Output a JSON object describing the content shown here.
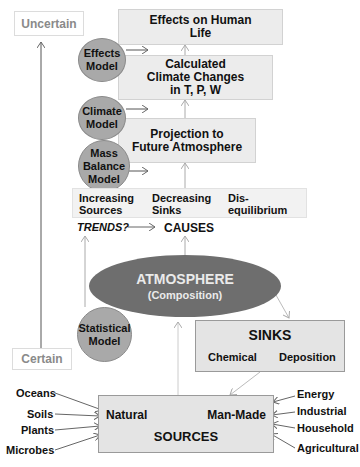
{
  "scale": {
    "top": "Uncertain",
    "bottom": "Certain"
  },
  "boxes": {
    "effects_life": [
      "Effects on Human",
      "Life"
    ],
    "climate_changes": [
      "Calculated",
      "Climate Changes",
      "in T, P, W"
    ],
    "projection": [
      "Projection to",
      "Future Atmosphere"
    ]
  },
  "models": {
    "effects": [
      "Effects",
      "Model"
    ],
    "climate": [
      "Climate",
      "Model"
    ],
    "mass_balance": [
      "Mass",
      "Balance",
      "Model"
    ],
    "statistical": [
      "Statistical",
      "Model"
    ]
  },
  "causes_band": {
    "items": [
      [
        "Increasing",
        "Sources"
      ],
      [
        "Decreasing",
        "Sinks"
      ],
      [
        "Dis-",
        "equilibrium"
      ]
    ]
  },
  "trends_label": "TRENDS?",
  "causes_label": "CAUSES",
  "atmosphere": {
    "title": "ATMOSPHERE",
    "subtitle": "(Composition)"
  },
  "sinks": {
    "title": "SINKS",
    "items": [
      "Chemical",
      "Deposition"
    ]
  },
  "sources": {
    "title": "SOURCES",
    "natural": "Natural",
    "man_made": "Man-Made",
    "natural_inputs": [
      "Oceans",
      "Soils",
      "Plants",
      "Microbes"
    ],
    "man_made_inputs": [
      "Energy",
      "Industrial",
      "Household",
      "Agricultural"
    ]
  },
  "colors": {
    "box_fill": "#ececec",
    "model_fill": "#a9a9a9",
    "atmosphere_fill": "#6e6e6e",
    "scale_text": "#8a8a8a"
  }
}
